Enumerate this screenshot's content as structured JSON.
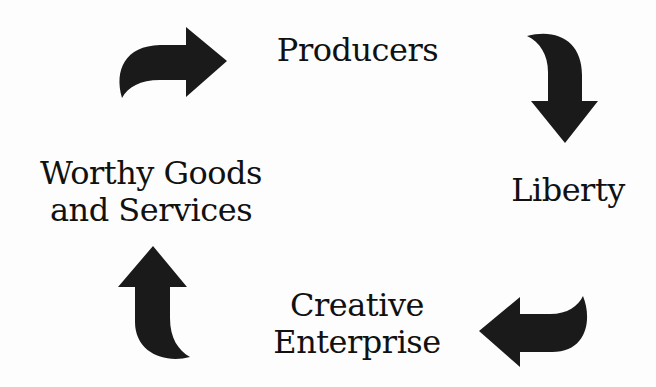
{
  "diagram": {
    "type": "cycle",
    "nodes": [
      {
        "id": "producers",
        "lines": [
          "Producers"
        ]
      },
      {
        "id": "liberty",
        "lines": [
          "Liberty"
        ]
      },
      {
        "id": "creative_enterprise",
        "lines": [
          "Creative",
          "Enterprise"
        ]
      },
      {
        "id": "worthy_goods",
        "lines": [
          "Worthy Goods",
          "and Services"
        ]
      }
    ],
    "edges": [
      {
        "from": "worthy_goods",
        "to": "producers",
        "icon": "curved-arrow-right-icon"
      },
      {
        "from": "producers",
        "to": "liberty",
        "icon": "curved-arrow-down-icon"
      },
      {
        "from": "liberty",
        "to": "creative_enterprise",
        "icon": "curved-arrow-left-icon"
      },
      {
        "from": "creative_enterprise",
        "to": "worthy_goods",
        "icon": "curved-arrow-up-icon"
      }
    ],
    "colors": {
      "arrow": "#1a1a1a",
      "text": "#111111",
      "background": "#fdfdfd"
    }
  }
}
